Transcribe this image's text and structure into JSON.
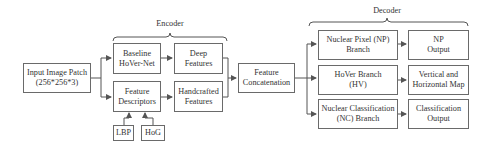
{
  "diagram": {
    "encoder_label": "Encoder",
    "decoder_label": "Decoder",
    "nodes": {
      "input": "Input Image Patch\n(256*256*3)",
      "baseline": "Baseline\nHoVer-Net",
      "feature_descriptors": "Feature\nDescriptors",
      "deep_features": "Deep\nFeatures",
      "handcrafted_features": "Handcrafted\nFeatures",
      "lbp": "LBP",
      "hog": "HoG",
      "concat": "Feature\nConcatenation",
      "np_branch": "Nuclear Pixel (NP)\nBranch",
      "hv_branch": "HoVer Branch\n(HV)",
      "nc_branch": "Nuclear Classification\n(NC) Branch",
      "np_output": "NP\nOutput",
      "hv_output": "Vertical and\nHorizontal Map",
      "nc_output": "Classification\nOutput"
    },
    "edges": [
      [
        "input",
        "baseline"
      ],
      [
        "input",
        "feature_descriptors"
      ],
      [
        "baseline",
        "deep_features"
      ],
      [
        "feature_descriptors",
        "handcrafted_features"
      ],
      [
        "lbp",
        "feature_descriptors"
      ],
      [
        "hog",
        "feature_descriptors"
      ],
      [
        "deep_features",
        "concat"
      ],
      [
        "handcrafted_features",
        "concat"
      ],
      [
        "concat",
        "np_branch"
      ],
      [
        "concat",
        "hv_branch"
      ],
      [
        "concat",
        "nc_branch"
      ],
      [
        "np_branch",
        "np_output"
      ],
      [
        "hv_branch",
        "hv_output"
      ],
      [
        "nc_branch",
        "nc_output"
      ]
    ]
  }
}
